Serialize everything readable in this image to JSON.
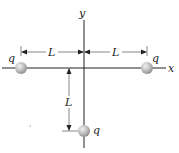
{
  "diagram": {
    "axes": {
      "x_label": "x",
      "y_label": "y"
    },
    "charges": [
      {
        "id": "left",
        "label": "q",
        "position": "(-L, 0)"
      },
      {
        "id": "right",
        "label": "q",
        "position": "(L, 0)"
      },
      {
        "id": "bottom",
        "label": "q",
        "position": "(0, -L)"
      }
    ],
    "dimensions": [
      {
        "id": "left-span",
        "label": "L"
      },
      {
        "id": "right-span",
        "label": "L"
      },
      {
        "id": "vertical-span",
        "label": "L"
      }
    ],
    "colors": {
      "axis": "#222222",
      "charge_fill": "#b8b8b8",
      "charge_highlight": "#eeeeee"
    },
    "stray_mark": "'"
  }
}
